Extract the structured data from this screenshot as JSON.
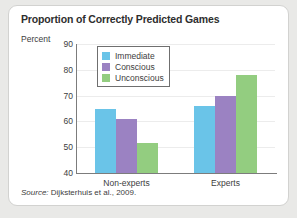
{
  "card": {
    "title": "Proportion of Correctly Predicted Games",
    "axis_unit_label": "Percent",
    "source": "Source: Dijksterhuis et al., 2009.",
    "source_prefix": "Source:",
    "source_rest": " Dijksterhuis et al., 2009."
  },
  "colors": {
    "immediate": "#6ac4e8",
    "conscious": "#9b82c2",
    "unconscious": "#93cd80",
    "axis": "#7c7c7c",
    "grid": "#ececec",
    "card_bg": "#ffffff",
    "page_bg": "#e9e9e7",
    "border": "#d2d2d0",
    "text": "#3d3d3d",
    "title_text": "#2e2e2e"
  },
  "legend": {
    "position": "inside-top-left",
    "items": [
      {
        "label": "Immediate",
        "color": "#6ac4e8"
      },
      {
        "label": "Conscious",
        "color": "#9b82c2"
      },
      {
        "label": "Unconscious",
        "color": "#93cd80"
      }
    ]
  },
  "chart_data": {
    "type": "bar",
    "title": "Proportion of Correctly Predicted Games",
    "xlabel": "",
    "ylabel": "Percent",
    "ylim": [
      40,
      90
    ],
    "yticks": [
      40,
      50,
      60,
      70,
      80,
      90
    ],
    "grid": true,
    "legend_position": "inside-top-left",
    "categories": [
      "Non-experts",
      "Experts"
    ],
    "series": [
      {
        "name": "Immediate",
        "color": "#6ac4e8",
        "values": [
          65,
          66
        ]
      },
      {
        "name": "Conscious",
        "color": "#9b82c2",
        "values": [
          61,
          70
        ]
      },
      {
        "name": "Unconscious",
        "color": "#93cd80",
        "values": [
          51.5,
          78
        ]
      }
    ]
  }
}
